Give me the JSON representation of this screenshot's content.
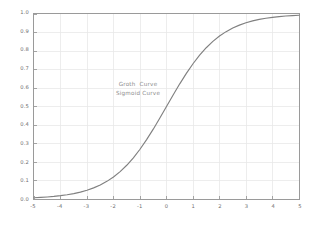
{
  "chart_data": {
    "type": "line",
    "title": "",
    "xlabel": "",
    "ylabel": "",
    "xlim": [
      -5,
      5
    ],
    "ylim": [
      0.0,
      1.0
    ],
    "grid": true,
    "legend_position": "none",
    "line_color": "#808080",
    "grid_color": "#e8e8e8",
    "axis_color": "#9a9a9a",
    "tick_label_color": "#6e6e6e",
    "annotation_color": "#8a8a8a",
    "background_color": "#ffffff",
    "xticks": [
      "-5",
      "-4",
      "-3",
      "-2",
      "-1",
      "0",
      "1",
      "2",
      "3",
      "4",
      "5"
    ],
    "xtick_values": [
      -5,
      -4,
      -3,
      -2,
      -1,
      0,
      1,
      2,
      3,
      4,
      5
    ],
    "yticks": [
      "0.0",
      "0.1",
      "0.2",
      "0.3",
      "0.4",
      "0.5",
      "0.6",
      "0.7",
      "0.8",
      "0.9",
      "1.0"
    ],
    "ytick_values": [
      0.0,
      0.1,
      0.2,
      0.3,
      0.4,
      0.5,
      0.6,
      0.7,
      0.8,
      0.9,
      1.0
    ],
    "annotations": [
      {
        "text": "Groth  Curve",
        "x": 0,
        "y": 0.62
      },
      {
        "text": "Sigmoid Curve",
        "x": 0,
        "y": 0.575
      }
    ],
    "series": [
      {
        "name": "Sigmoid Curve",
        "formula": "y = 1 / (1 + exp(-x))",
        "x": [
          -5.0,
          -4.75,
          -4.5,
          -4.25,
          -4.0,
          -3.75,
          -3.5,
          -3.25,
          -3.0,
          -2.75,
          -2.5,
          -2.25,
          -2.0,
          -1.75,
          -1.5,
          -1.25,
          -1.0,
          -0.75,
          -0.5,
          -0.25,
          0.0,
          0.25,
          0.5,
          0.75,
          1.0,
          1.25,
          1.5,
          1.75,
          2.0,
          2.25,
          2.5,
          2.75,
          3.0,
          3.25,
          3.5,
          3.75,
          4.0,
          4.25,
          4.5,
          4.75,
          5.0
        ],
        "y": [
          0.0067,
          0.0086,
          0.011,
          0.0141,
          0.018,
          0.023,
          0.0293,
          0.0373,
          0.0474,
          0.0601,
          0.0759,
          0.0954,
          0.1192,
          0.148,
          0.1824,
          0.2227,
          0.2689,
          0.3208,
          0.3775,
          0.4378,
          0.5,
          0.5622,
          0.6225,
          0.6792,
          0.7311,
          0.7773,
          0.8176,
          0.852,
          0.8808,
          0.9046,
          0.9241,
          0.9399,
          0.9526,
          0.9627,
          0.9707,
          0.977,
          0.982,
          0.9859,
          0.989,
          0.9914,
          0.9933
        ]
      }
    ]
  }
}
